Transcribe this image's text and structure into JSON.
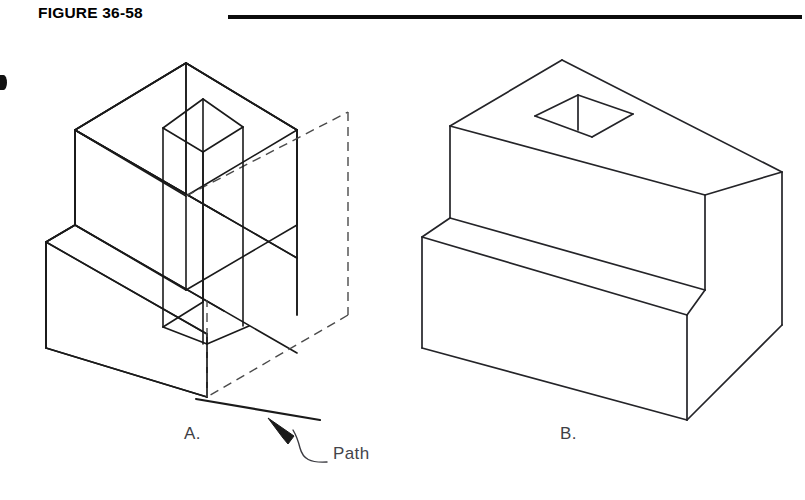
{
  "figure": {
    "title": "FIGURE 36-58",
    "rule_color": "#0c0c0c",
    "line_color": "#1a1a1a",
    "dashed_color": "#4a4a4a",
    "background": "#ffffff"
  },
  "views": [
    {
      "id": "a",
      "caption": "A.",
      "description": "Isometric wireframe of stepped block with rectangular tool prism passing vertically through it, hidden edges dashed",
      "annotation": {
        "label": "Path",
        "leader": "curved-leader-with-arrowhead"
      }
    },
    {
      "id": "b",
      "caption": "B.",
      "description": "Isometric solid of finished stepped block with square through-hole in top face"
    }
  ],
  "annotations": {
    "path_label": "Path"
  },
  "icons": {
    "arrowhead": "arrowhead-icon",
    "edge_mark": "page-edge-mark-icon"
  }
}
